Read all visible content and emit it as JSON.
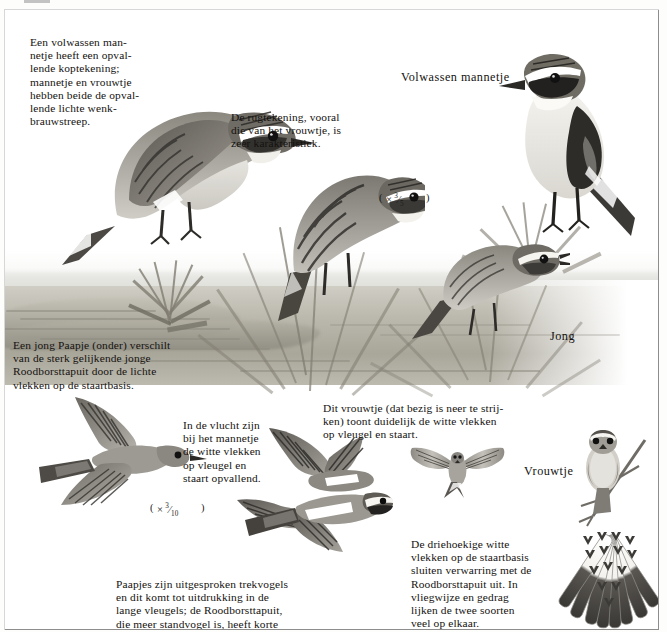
{
  "plate": {
    "title_not_visible": "",
    "crop_mark": "page-trim-mark",
    "background_color": "#ffffff",
    "frame_color": "#8d8d8d"
  },
  "labels": [
    {
      "id": "adult-male",
      "text": "Volwassen mannetje"
    },
    {
      "id": "juvenile",
      "text": "Jong"
    },
    {
      "id": "female",
      "text": "Vrouwtje"
    }
  ],
  "scales": [
    {
      "id": "scale-upper",
      "text": "(× ⁵⁄₉)",
      "display": "( × ⅓ )",
      "symbol": "×",
      "numerator": "3",
      "denominator": "5"
    },
    {
      "id": "scale-lower",
      "symbol": "×",
      "numerator": "3",
      "denominator": "10"
    }
  ],
  "captions": [
    {
      "id": "head-pattern",
      "text": "Een volwassen man-\nnetje heeft een opval-\nlende koptekening;\nmannetje en vrouwtje\nhebben beide de opval-\nlende lichte wenk-\nbrauwstreep."
    },
    {
      "id": "back-pattern",
      "text": "De rugtekening, vooral\ndie van het vrouwtje, is\nzeer karakteristiek."
    },
    {
      "id": "juvenile-vs-stonechat",
      "text": "Een jong Paapje (onder) verschilt\nvan de sterk gelijkende jonge\nRoodborsttapuit door de lichte\nvlekken op de staartbasis."
    },
    {
      "id": "male-in-flight",
      "text": "In de vlucht zijn\nbij het mannetje\nde witte vlekken\nop vleugel en\nstaart opvallend."
    },
    {
      "id": "female-landing",
      "text": "Dit vrouwtje (dat bezig is neer te strij-\nken) toont duidelijk de witte vlekken\nop vleugel en staart."
    },
    {
      "id": "migration-wings",
      "text": "Paapjes zijn uitgesproken trekvogels\nen dit komt tot uitdrukking in de\nlange vleugels; de Roodborsttapuit,\ndie meer standvogel is, heeft korte\nvleugels."
    },
    {
      "id": "tail-base-spots",
      "text": "De driehoekige witte\nvlekken op de staartbasis\nsluiten verwarring met de\nRoodborsttapuit uit. In\nvliegwijze en gedrag\nlijken de twee soorten\nveel op elkaar."
    }
  ],
  "illustrations": [
    {
      "id": "perched-male-large",
      "name": "adult-male-perched-large"
    },
    {
      "id": "singing-bird-center",
      "name": "bird-singing-center"
    },
    {
      "id": "adult-male-right",
      "name": "adult-male-standing-right"
    },
    {
      "id": "juvenile-right",
      "name": "juvenile-perched-right"
    },
    {
      "id": "flying-juvenile-left",
      "name": "juvenile-in-flight-left"
    },
    {
      "id": "flying-males-center",
      "name": "males-in-flight-center"
    },
    {
      "id": "female-landing-small",
      "name": "female-landing-small"
    },
    {
      "id": "female-frontal",
      "name": "female-frontal-on-branch"
    },
    {
      "id": "spread-tail",
      "name": "spread-tail-detail"
    }
  ]
}
